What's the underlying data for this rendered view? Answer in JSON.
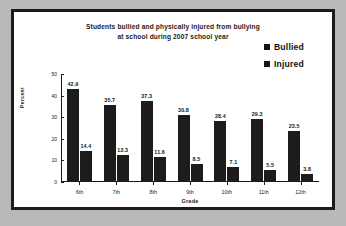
{
  "chart_data": {
    "type": "bar",
    "title": "Students bullied and physically injured from bullying at school during 2007 school year",
    "title_line1": "Students bullied and physically injured from bullying",
    "title_line2": "at school during 2007 school year",
    "xlabel": "Grade",
    "ylabel": "Percent",
    "ylim": [
      0,
      50
    ],
    "yticks": [
      "0",
      "10",
      "20",
      "30",
      "40",
      "50"
    ],
    "grid": false,
    "legend_position": "top-right",
    "categories": [
      "6th",
      "7th",
      "8th",
      "9th",
      "10th",
      "11th",
      "12th"
    ],
    "series": [
      {
        "name": "Bullied",
        "color": "#1c1c1c",
        "values": [
          42.9,
          35.7,
          37.3,
          30.8,
          28.4,
          29.3,
          23.5
        ],
        "labels": [
          "42.9",
          "35.7",
          "37.3",
          "30.8",
          "28.4",
          "29.3",
          "23.5"
        ]
      },
      {
        "name": "Injured",
        "color": "#1c1c1c",
        "values": [
          14.4,
          12.3,
          11.6,
          8.5,
          7.1,
          5.5,
          3.8
        ],
        "labels": [
          "14.4",
          "12.3",
          "11.6",
          "8.5",
          "7.1",
          "5.5",
          "3.8"
        ]
      }
    ]
  },
  "legend": {
    "items": [
      {
        "label": "Bullied"
      },
      {
        "label": "Injured"
      }
    ]
  },
  "colors": {
    "bar": "#1c1c1c",
    "frame": "#1b1b1b",
    "background": "#ffffff",
    "page_background": "#b9b9b7"
  }
}
